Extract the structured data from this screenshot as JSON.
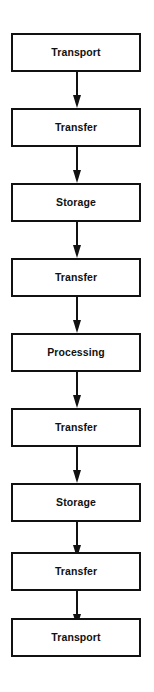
{
  "diagram": {
    "type": "vertical-flowchart",
    "orientation": "top-to-bottom",
    "background_color": "#ffffff",
    "line_color": "#111111",
    "text_color": "#111111",
    "node_count": 9,
    "connector_count": 8,
    "nodes": [
      {
        "id": "node-1",
        "label": "Transport"
      },
      {
        "id": "node-2",
        "label": "Transfer"
      },
      {
        "id": "node-3",
        "label": "Storage"
      },
      {
        "id": "node-4",
        "label": "Transfer"
      },
      {
        "id": "node-5",
        "label": "Processing"
      },
      {
        "id": "node-6",
        "label": "Transfer"
      },
      {
        "id": "node-7",
        "label": "Storage"
      },
      {
        "id": "node-8",
        "label": "Transfer"
      },
      {
        "id": "node-9",
        "label": "Transport"
      }
    ],
    "connectors": [
      {
        "id": "arrow-1",
        "from": "node-1",
        "to": "node-2",
        "icon": "arrow-down-icon"
      },
      {
        "id": "arrow-2",
        "from": "node-2",
        "to": "node-3",
        "icon": "arrow-down-icon"
      },
      {
        "id": "arrow-3",
        "from": "node-3",
        "to": "node-4",
        "icon": "arrow-down-icon"
      },
      {
        "id": "arrow-4",
        "from": "node-4",
        "to": "node-5",
        "icon": "arrow-down-icon"
      },
      {
        "id": "arrow-5",
        "from": "node-5",
        "to": "node-6",
        "icon": "arrow-down-icon"
      },
      {
        "id": "arrow-6",
        "from": "node-6",
        "to": "node-7",
        "icon": "arrow-down-icon"
      },
      {
        "id": "arrow-7",
        "from": "node-7",
        "to": "node-8",
        "icon": "arrow-down-icon"
      },
      {
        "id": "arrow-8",
        "from": "node-8",
        "to": "node-9",
        "icon": "arrow-down-icon"
      }
    ]
  }
}
